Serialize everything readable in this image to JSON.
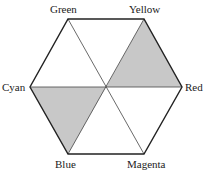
{
  "diagram": {
    "type": "color-hexagon",
    "labels": {
      "green": "Green",
      "yellow": "Yellow",
      "red": "Red",
      "magenta": "Magenta",
      "blue": "Blue",
      "cyan": "Cyan"
    },
    "shaded_triangles": [
      "Yellow-Red-center",
      "Cyan-Blue-center"
    ],
    "shade_color": "#c8c8c8",
    "line_color": "#222222"
  }
}
